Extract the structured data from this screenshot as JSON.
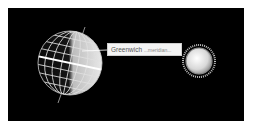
{
  "diagram": {
    "background": "#000000",
    "earth": {
      "label": "Earth globe",
      "grid_color": "#e6e6e6",
      "equator_color": "#ffffff"
    },
    "sun": {
      "label": "Sun"
    },
    "callout": {
      "primary": "Greenwich",
      "secondary": "...meridian..."
    }
  }
}
